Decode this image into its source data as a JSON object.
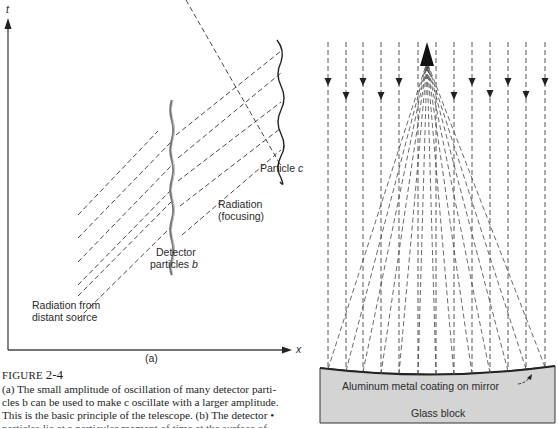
{
  "figure": {
    "label": "FIGURE",
    "number": "2-4",
    "caption_lines": [
      "(a) The small amplitude of oscillation of many detector parti-",
      "cles b can be used to make c oscillate with a larger amplitude.",
      "This is the basic principle of the telescope. (b) The detector •",
      "particles lie at a particular moment of time at the surface of"
    ]
  },
  "panel_a": {
    "sublabel": "(a)",
    "axes": {
      "y_label": "t",
      "x_label": "x"
    },
    "labels": {
      "particle_c": "Particle c",
      "radiation_focusing_1": "Radiation",
      "radiation_focusing_2": "(focusing)",
      "detector_1": "Detector",
      "detector_2": "particles b",
      "source_1": "Radiation from",
      "source_2": "distant source"
    }
  },
  "panel_b": {
    "mirror_label": "Aluminum metal coating on mirror",
    "block_label": "Glass block",
    "colors": {
      "glass": "#d4d4d4",
      "line": "#333333"
    }
  }
}
